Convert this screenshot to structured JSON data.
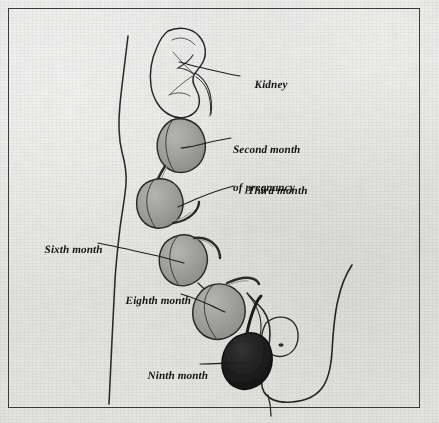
{
  "figure": {
    "type": "anatomical-illustration",
    "background_color": "#e9e9e7",
    "border_color": "#3a3a3a",
    "ink_color": "#1a1a1a",
    "organ_fill_gray": "#9b9b99",
    "organ_fill_dark": "#1c1c1c",
    "body_outline_color": "#262626"
  },
  "labels": [
    {
      "id": "kidney",
      "name": "kidney-label",
      "lines": [
        "Kidney"
      ],
      "x": 243,
      "y": 72,
      "align": "left"
    },
    {
      "id": "second-month",
      "name": "second-month-label",
      "lines": [
        "Second month",
        "of pregnancy"
      ],
      "x": 233,
      "y": 125,
      "align": "left"
    },
    {
      "id": "third-month",
      "name": "third-month-label",
      "lines": [
        "Third month"
      ],
      "x": 236,
      "y": 178,
      "align": "left"
    },
    {
      "id": "sixth-month",
      "name": "sixth-month-label",
      "lines": [
        "Sixth month"
      ],
      "x": 35,
      "y": 237,
      "align": "left"
    },
    {
      "id": "eighth-month",
      "name": "eighth-month-label",
      "lines": [
        "Eighth month"
      ],
      "x": 115,
      "y": 288,
      "align": "left"
    },
    {
      "id": "ninth-month",
      "name": "ninth-month-label",
      "lines": [
        "Ninth month"
      ],
      "x": 136,
      "y": 358,
      "align": "left"
    }
  ],
  "structures": [
    {
      "id": "kidney",
      "label": "Kidney",
      "fill": "none",
      "month": null
    },
    {
      "id": "uterus-2",
      "label": "Second month of pregnancy",
      "fill": "#9b9b99",
      "month": 2
    },
    {
      "id": "uterus-3",
      "label": "Third month",
      "fill": "#9b9b99",
      "month": 3
    },
    {
      "id": "uterus-6",
      "label": "Sixth month",
      "fill": "#9b9b99",
      "month": 6
    },
    {
      "id": "uterus-8",
      "label": "Eighth month",
      "fill": "#9b9b99",
      "month": 8
    },
    {
      "id": "uterus-9",
      "label": "Ninth month",
      "fill": "#1c1c1c",
      "month": 9
    },
    {
      "id": "bladder",
      "label": "Bladder",
      "fill": "none",
      "month": null
    },
    {
      "id": "body-contour",
      "label": "Abdominal wall contour",
      "fill": "none",
      "month": null
    },
    {
      "id": "pelvis-thigh",
      "label": "Pelvis and thigh outline",
      "fill": "none",
      "month": null
    }
  ]
}
